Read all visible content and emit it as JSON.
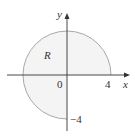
{
  "diagram": {
    "region_label": "R",
    "origin_label": "0",
    "x_axis_label": "x",
    "y_axis_label": "y",
    "x_tick_label": "4",
    "y_tick_label": "−4",
    "region_description": "Disk of radius 4 centered at origin excluding the fourth quadrant",
    "colors": {
      "fill": "#f4f4f4",
      "boundary": "#a8a8a8",
      "axes": "#333333"
    }
  }
}
